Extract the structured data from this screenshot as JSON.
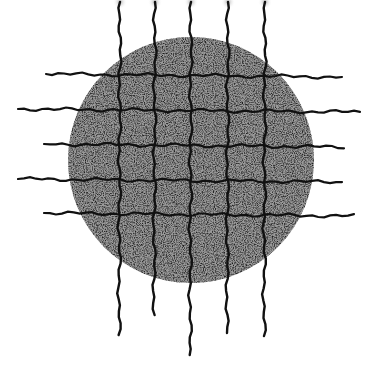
{
  "image": {
    "description": "Hand-drawn ink illustration of a stippled/textured circle overlaid by a grid of wavy lines",
    "background": "#ffffff",
    "ink_color": "#111111",
    "circle": {
      "cx": 191,
      "cy": 160,
      "r": 123,
      "fill": "#6a6a6a"
    },
    "vertical_lines": [
      {
        "x": 120,
        "y1": 2,
        "y2": 335
      },
      {
        "x": 155,
        "y1": 2,
        "y2": 315
      },
      {
        "x": 191,
        "y1": 2,
        "y2": 355
      },
      {
        "x": 228,
        "y1": 2,
        "y2": 333
      },
      {
        "x": 265,
        "y1": 2,
        "y2": 336
      }
    ],
    "horizontal_lines": [
      {
        "y": 75,
        "x1": 46,
        "x2": 342
      },
      {
        "y": 110,
        "x1": 18,
        "x2": 360
      },
      {
        "y": 145,
        "x1": 44,
        "x2": 344
      },
      {
        "y": 180,
        "x1": 18,
        "x2": 342
      },
      {
        "y": 214,
        "x1": 44,
        "x2": 354
      }
    ],
    "top_glow_color": "#bbbbbb"
  }
}
